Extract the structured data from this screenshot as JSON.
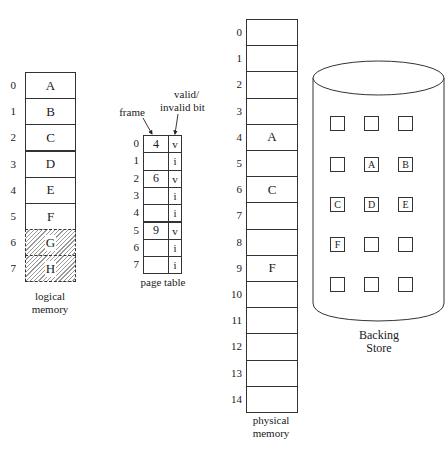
{
  "logical_memory": {
    "label_line1": "logical",
    "label_line2": "memory",
    "pages": [
      {
        "index": "0",
        "content": "A",
        "shaded": false
      },
      {
        "index": "1",
        "content": "B",
        "shaded": false
      },
      {
        "index": "2",
        "content": "C",
        "shaded": false
      },
      {
        "index": "3",
        "content": "D",
        "shaded": false
      },
      {
        "index": "4",
        "content": "E",
        "shaded": false
      },
      {
        "index": "5",
        "content": "F",
        "shaded": false
      },
      {
        "index": "6",
        "content": "G",
        "shaded": true
      },
      {
        "index": "7",
        "content": "H",
        "shaded": true
      }
    ]
  },
  "page_table": {
    "label": "page table",
    "frame_header": "frame",
    "bit_header_line1": "valid/",
    "bit_header_line2": "invalid bit",
    "entries": [
      {
        "index": "0",
        "frame": "4",
        "bit": "v"
      },
      {
        "index": "1",
        "frame": "",
        "bit": "i"
      },
      {
        "index": "2",
        "frame": "6",
        "bit": "v"
      },
      {
        "index": "3",
        "frame": "",
        "bit": "i"
      },
      {
        "index": "4",
        "frame": "",
        "bit": "i"
      },
      {
        "index": "5",
        "frame": "9",
        "bit": "v"
      },
      {
        "index": "6",
        "frame": "",
        "bit": "i"
      },
      {
        "index": "7",
        "frame": "",
        "bit": "i"
      }
    ]
  },
  "physical_memory": {
    "label_line1": "physical",
    "label_line2": "memory",
    "frames": [
      {
        "index": "0",
        "content": ""
      },
      {
        "index": "1",
        "content": ""
      },
      {
        "index": "2",
        "content": ""
      },
      {
        "index": "3",
        "content": ""
      },
      {
        "index": "4",
        "content": "A"
      },
      {
        "index": "5",
        "content": ""
      },
      {
        "index": "6",
        "content": "C"
      },
      {
        "index": "7",
        "content": ""
      },
      {
        "index": "8",
        "content": ""
      },
      {
        "index": "9",
        "content": "F"
      },
      {
        "index": "10",
        "content": ""
      },
      {
        "index": "11",
        "content": ""
      },
      {
        "index": "12",
        "content": ""
      },
      {
        "index": "13",
        "content": ""
      },
      {
        "index": "14",
        "content": ""
      }
    ]
  },
  "backing_store": {
    "label_line1": "Backing",
    "label_line2": "Store",
    "grid": [
      [
        "",
        "",
        ""
      ],
      [
        "",
        "A",
        "B"
      ],
      [
        "C",
        "D",
        "E"
      ],
      [
        "F",
        "",
        ""
      ],
      [
        "",
        "",
        ""
      ]
    ]
  }
}
